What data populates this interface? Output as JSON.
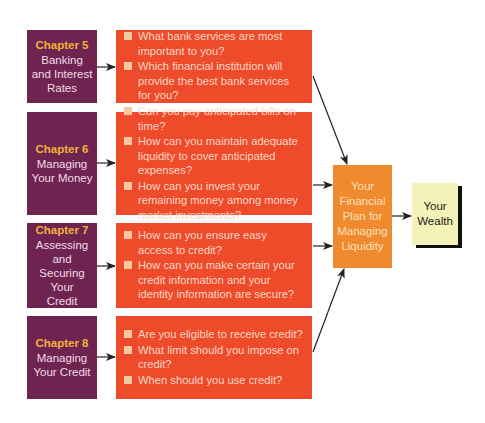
{
  "diagram": {
    "chapters": [
      {
        "number_label": "Chapter 5",
        "title": "Banking and Interest Rates",
        "questions": [
          "What bank services are most important to you?",
          "Which financial institution will provide the best bank services for you?"
        ]
      },
      {
        "number_label": "Chapter 6",
        "title": "Managing Your Money",
        "questions": [
          "Can you pay anticipated bills on time?",
          "How can you maintain adequate liquidity to cover anticipated expenses?",
          "How can you invest your remaining money among money market investments?"
        ]
      },
      {
        "number_label": "Chapter 7",
        "title": "Assessing and Securing Your Credit",
        "questions": [
          "How can you ensure easy access to credit?",
          "How can you make certain your credit information and your identity information are secure?"
        ]
      },
      {
        "number_label": "Chapter 8",
        "title": "Managing Your Credit",
        "questions": [
          "Are you eligible to receive credit?",
          "What limit should you impose on credit?",
          "When should you use credit?"
        ]
      }
    ],
    "plan_box": {
      "label": "Your Financial Plan for Managing Liquidity"
    },
    "wealth_box": {
      "label": "Your Wealth"
    },
    "colors": {
      "chapter_bg": "#6e2350",
      "chapter_number": "#f2b33a",
      "question_bg": "#ee4b2b",
      "plan_bg": "#ef8a2e",
      "wealth_bg": "#f5f2b8",
      "arrow": "#222222"
    }
  }
}
